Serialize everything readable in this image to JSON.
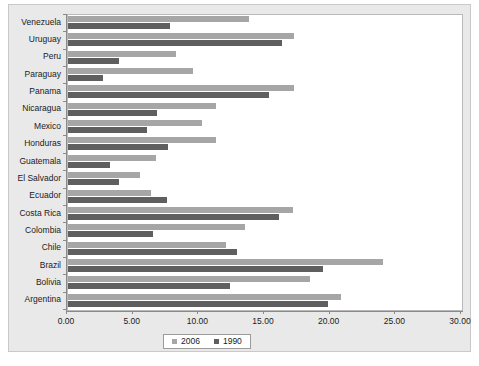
{
  "chart_data": {
    "type": "bar",
    "orientation": "horizontal",
    "title": "",
    "subtitle": "",
    "xlabel": "",
    "ylabel": "",
    "xlim": [
      0,
      30
    ],
    "xticks": [
      "0.00",
      "5.00",
      "10.00",
      "15.00",
      "20.00",
      "25.00",
      "30.00"
    ],
    "xtick_values": [
      0,
      5,
      10,
      15,
      20,
      25,
      30
    ],
    "grid": false,
    "legend_position": "bottom",
    "categories": [
      "Venezuela",
      "Uruguay",
      "Peru",
      "Paraguay",
      "Panama",
      "Nicaragua",
      "Mexico",
      "Honduras",
      "Guatemala",
      "El Salvador",
      "Ecuador",
      "Costa Rica",
      "Colombia",
      "Chile",
      "Brazil",
      "Bolivia",
      "Argentina"
    ],
    "series": [
      {
        "name": "2006",
        "color": "#a6a6a6",
        "values": [
          13.8,
          17.2,
          8.2,
          9.5,
          17.2,
          11.3,
          10.2,
          11.3,
          6.7,
          5.5,
          6.3,
          17.1,
          13.5,
          12.0,
          24.0,
          18.4,
          20.8
        ]
      },
      {
        "name": "1990",
        "color": "#5f5f5f",
        "values": [
          7.8,
          16.3,
          3.9,
          2.7,
          15.3,
          6.8,
          6.0,
          7.6,
          3.2,
          3.9,
          7.5,
          16.1,
          6.5,
          12.9,
          19.4,
          12.3,
          19.8
        ]
      }
    ],
    "legend": [
      {
        "label": "2006",
        "color": "#a6a6a6"
      },
      {
        "label": "1990",
        "color": "#5f5f5f"
      }
    ]
  },
  "colors": {
    "series_2006": "#a6a6a6",
    "series_1990": "#5f5f5f",
    "plot_background": "#ffffff",
    "card_background": "#e9e9e9",
    "axis": "#8a8a8a",
    "text": "#1b1b1b"
  }
}
